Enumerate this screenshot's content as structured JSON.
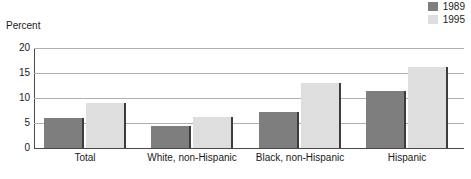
{
  "title_remnant": "",
  "axis_title": "Percent",
  "legend": {
    "position": "top-right",
    "items": [
      {
        "label": "1989",
        "color": "#7e7e7e"
      },
      {
        "label": "1995",
        "color": "#dedede"
      }
    ]
  },
  "chart_data": {
    "type": "bar",
    "title": "",
    "subtitle": "",
    "xlabel": "",
    "ylabel": "Percent",
    "ylim": [
      0,
      20
    ],
    "yticks": [
      "0",
      "5",
      "10",
      "15",
      "20"
    ],
    "ytick_values": [
      0,
      5,
      10,
      15,
      20
    ],
    "grid": true,
    "legend_position": "top-right",
    "categories": [
      "Total",
      "White, non-Hispanic",
      "Black, non-Hispanic",
      "Hispanic"
    ],
    "series": [
      {
        "name": "1989",
        "color": "#7e7e7e",
        "values": [
          6.0,
          4.3,
          7.2,
          11.3
        ]
      },
      {
        "name": "1995",
        "color": "#dedede",
        "values": [
          9.0,
          6.1,
          13.0,
          16.2
        ]
      }
    ]
  }
}
